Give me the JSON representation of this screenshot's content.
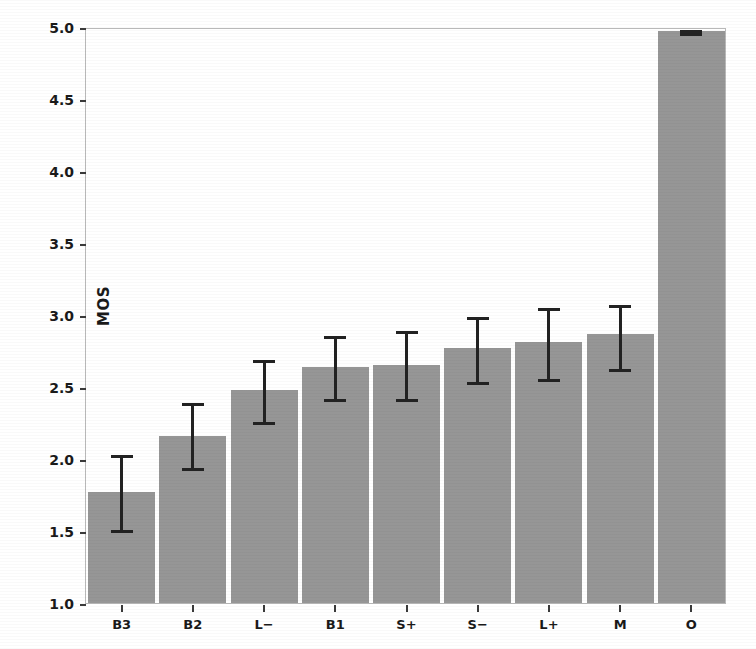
{
  "chart_data": {
    "type": "bar",
    "title": "",
    "xlabel": "",
    "ylabel": "MOS",
    "ylim": [
      1.0,
      5.0
    ],
    "yticks": [
      1.0,
      1.5,
      2.0,
      2.5,
      3.0,
      3.5,
      4.0,
      4.5,
      5.0
    ],
    "ytick_labels": [
      "1.0",
      "1.5",
      "2.0",
      "2.5",
      "3.0",
      "3.5",
      "4.0",
      "4.5",
      "5.0"
    ],
    "grid": false,
    "legend": null,
    "bar_color": "#969696",
    "error_color": "#222222",
    "categories": [
      "B3",
      "B2",
      "L−",
      "B1",
      "S+",
      "S−",
      "L+",
      "M",
      "O"
    ],
    "values": [
      1.77,
      2.16,
      2.48,
      2.64,
      2.65,
      2.77,
      2.81,
      2.87,
      4.97
    ],
    "error_low": [
      1.5,
      1.93,
      2.25,
      2.41,
      2.41,
      2.53,
      2.55,
      2.62,
      4.95
    ],
    "error_high": [
      2.04,
      2.4,
      2.7,
      2.87,
      2.9,
      3.0,
      3.06,
      3.08,
      4.99
    ],
    "series": [
      {
        "name": "MOS",
        "points": [
          {
            "category": "B3",
            "value": 1.77,
            "ci_low": 1.5,
            "ci_high": 2.04
          },
          {
            "category": "B2",
            "value": 2.16,
            "ci_low": 1.93,
            "ci_high": 2.4
          },
          {
            "category": "L−",
            "value": 2.48,
            "ci_low": 2.25,
            "ci_high": 2.7
          },
          {
            "category": "B1",
            "value": 2.64,
            "ci_low": 2.41,
            "ci_high": 2.87
          },
          {
            "category": "S+",
            "value": 2.65,
            "ci_low": 2.41,
            "ci_high": 2.9
          },
          {
            "category": "S−",
            "value": 2.77,
            "ci_low": 2.53,
            "ci_high": 3.0
          },
          {
            "category": "L+",
            "value": 2.81,
            "ci_low": 2.55,
            "ci_high": 3.06
          },
          {
            "category": "M",
            "value": 2.87,
            "ci_low": 2.62,
            "ci_high": 3.08
          },
          {
            "category": "O",
            "value": 4.97,
            "ci_low": 4.95,
            "ci_high": 4.99
          }
        ]
      }
    ]
  }
}
